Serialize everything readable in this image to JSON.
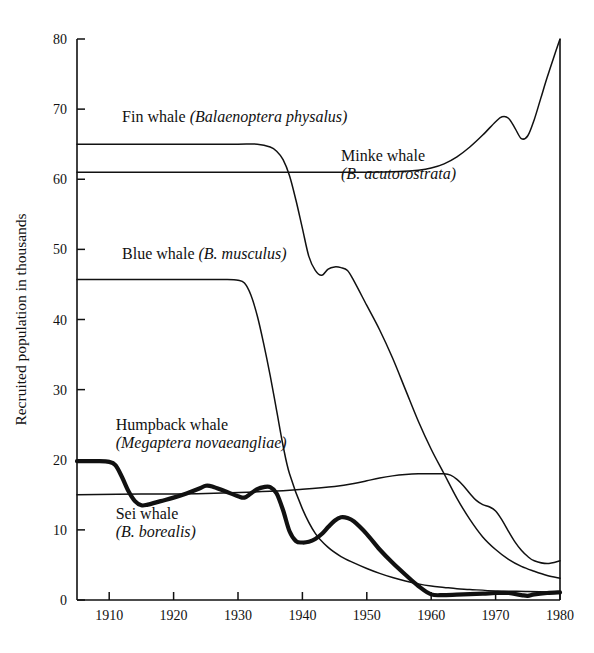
{
  "chart_data": {
    "type": "line",
    "title": "",
    "xlabel": "",
    "ylabel": "Recruited population in thousands",
    "xlim": [
      1905,
      1980
    ],
    "ylim": [
      0,
      80
    ],
    "grid": false,
    "legend_position": "inline-annotations",
    "xticks": [
      1910,
      1920,
      1930,
      1940,
      1950,
      1960,
      1970,
      1980
    ],
    "yticks": [
      0,
      10,
      20,
      30,
      40,
      50,
      60,
      70,
      80
    ],
    "series": [
      {
        "name": "Fin whale",
        "scientific_name": "Balaenoptera physalus",
        "style": "thin",
        "x": [
          1905,
          1910,
          1915,
          1920,
          1925,
          1930,
          1933,
          1935,
          1936,
          1937,
          1938,
          1939,
          1940,
          1941,
          1942,
          1943,
          1944,
          1945,
          1946,
          1947,
          1948,
          1950,
          1952,
          1954,
          1956,
          1958,
          1960,
          1962,
          1964,
          1966,
          1968,
          1970,
          1972,
          1974,
          1976,
          1978,
          1980
        ],
        "y": [
          65,
          65,
          65,
          65,
          65,
          65,
          65,
          64.6,
          64,
          62.8,
          60.5,
          57,
          53,
          49,
          47,
          46.3,
          47.2,
          47.5,
          47.4,
          47,
          45.5,
          42,
          38.5,
          34.5,
          30,
          25.5,
          21.5,
          18,
          14.5,
          11.5,
          9,
          7.2,
          5.8,
          4.8,
          4.1,
          3.5,
          3.1
        ]
      },
      {
        "name": "Minke whale",
        "scientific_name": "B. acutorostrata",
        "style": "thin",
        "x": [
          1905,
          1915,
          1925,
          1935,
          1945,
          1950,
          1955,
          1958,
          1960,
          1962,
          1964,
          1966,
          1968,
          1970,
          1971,
          1972,
          1973,
          1974,
          1975,
          1976,
          1977,
          1978,
          1979,
          1980
        ],
        "y": [
          61,
          61,
          61,
          61,
          61,
          61,
          61.1,
          61.3,
          61.6,
          62.2,
          63.2,
          64.6,
          66.3,
          68.2,
          68.9,
          68.7,
          67.3,
          65.8,
          66.2,
          68.5,
          71.5,
          74.5,
          77.3,
          80
        ]
      },
      {
        "name": "Blue whale",
        "scientific_name": "B. musculus",
        "style": "thin",
        "x": [
          1905,
          1910,
          1915,
          1920,
          1925,
          1928,
          1930,
          1931,
          1932,
          1933,
          1934,
          1935,
          1936,
          1937,
          1938,
          1940,
          1942,
          1944,
          1946,
          1948,
          1950,
          1952,
          1954,
          1956,
          1958,
          1960,
          1962,
          1964,
          1966,
          1970,
          1975,
          1980
        ],
        "y": [
          45.7,
          45.7,
          45.7,
          45.7,
          45.7,
          45.7,
          45.6,
          45.2,
          43.5,
          40.5,
          36.5,
          32,
          27,
          22,
          18,
          13,
          9.5,
          7.5,
          6.2,
          5.3,
          4.5,
          3.8,
          3.2,
          2.7,
          2.3,
          2.0,
          1.8,
          1.6,
          1.5,
          1.3,
          1.2,
          1.1
        ]
      },
      {
        "name": "Sei whale",
        "scientific_name": "B. borealis",
        "style": "thin",
        "x": [
          1905,
          1915,
          1925,
          1935,
          1940,
          1945,
          1948,
          1950,
          1952,
          1954,
          1956,
          1958,
          1960,
          1962,
          1963,
          1964,
          1965,
          1966,
          1967,
          1968,
          1969,
          1970,
          1971,
          1972,
          1973,
          1974,
          1975,
          1976,
          1978,
          1980
        ],
        "y": [
          15,
          15.1,
          15.2,
          15.5,
          15.8,
          16.2,
          16.6,
          17,
          17.4,
          17.7,
          17.9,
          18,
          18,
          18,
          17.8,
          17.2,
          16.3,
          15.2,
          14.2,
          13.6,
          13.3,
          12.7,
          11.4,
          9.8,
          8.3,
          7.1,
          6.2,
          5.6,
          5.2,
          5.6
        ]
      },
      {
        "name": "Humpback whale",
        "scientific_name": "Megaptera novaeangliae",
        "style": "bold",
        "x": [
          1905,
          1908,
          1910,
          1911,
          1912,
          1913,
          1914,
          1915,
          1916,
          1918,
          1920,
          1922,
          1924,
          1925,
          1926,
          1928,
          1930,
          1931,
          1932,
          1933,
          1934,
          1935,
          1936,
          1937,
          1938,
          1939,
          1940,
          1941,
          1942,
          1943,
          1944,
          1945,
          1946,
          1947,
          1948,
          1950,
          1952,
          1954,
          1956,
          1958,
          1960,
          1962,
          1965,
          1968,
          1970,
          1972,
          1974,
          1975,
          1976,
          1978,
          1980
        ],
        "y": [
          19.8,
          19.8,
          19.7,
          19.2,
          17.5,
          15.5,
          14.1,
          13.5,
          13.6,
          14.1,
          14.6,
          15.2,
          15.9,
          16.3,
          16.2,
          15.5,
          14.8,
          14.6,
          15.2,
          15.8,
          16.1,
          16.1,
          15.2,
          12.8,
          9.8,
          8.4,
          8.2,
          8.3,
          8.7,
          9.4,
          10.4,
          11.3,
          11.8,
          11.7,
          11.2,
          9.4,
          7.2,
          5.3,
          3.6,
          2.0,
          0.8,
          0.7,
          0.8,
          0.9,
          1.0,
          1.0,
          0.7,
          0.6,
          0.8,
          1.0,
          1.1
        ]
      }
    ],
    "annotations": [
      {
        "id": "fin",
        "text": "Fin whale ",
        "text_italic": "(Balaenoptera physalus)",
        "x": 1912,
        "y": 68.2
      },
      {
        "id": "minke",
        "text": "Minke whale",
        "text_italic": "(B. acutorostrata)",
        "x": 1946,
        "y": 62.6
      },
      {
        "id": "blue",
        "text": "Blue whale ",
        "text_italic": "(B. musculus)",
        "x": 1912,
        "y": 48.6
      },
      {
        "id": "humpback",
        "text": "Humpback whale",
        "text_italic": "(Megaptera novaeangliae)",
        "x": 1911,
        "y": 24.2
      },
      {
        "id": "sei",
        "text": "Sei whale",
        "text_italic": "(B. borealis)",
        "x": 1911,
        "y": 11.6
      }
    ],
    "colors": {
      "line": "#111111",
      "background": "#ffffff",
      "text": "#111111"
    }
  }
}
